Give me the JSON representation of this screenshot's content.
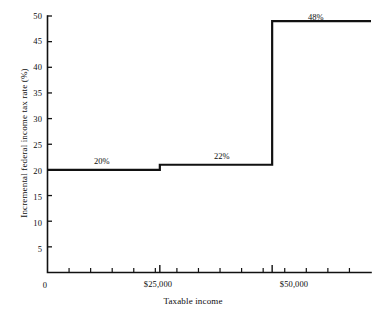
{
  "chart_data": {
    "type": "line",
    "subtype": "step",
    "title": "",
    "xlabel": "Taxable income",
    "ylabel": "Incremental federal income tax rate (%)",
    "xlim": [
      0,
      72000
    ],
    "ylim": [
      0,
      50
    ],
    "grid": false,
    "legend": "none",
    "y_ticks": [
      0,
      5,
      10,
      15,
      20,
      25,
      30,
      35,
      40,
      45,
      50
    ],
    "y_tick_labels": [
      "0",
      "5",
      "10",
      "15",
      "20",
      "25",
      "30",
      "35",
      "40",
      "45",
      "50"
    ],
    "y_tick_direction": "inward",
    "x_tick_labels": [
      "0",
      "$25,000",
      "$50,000"
    ],
    "x_tick_values": [
      0,
      25000,
      50000
    ],
    "x_minor_tick_count": 14,
    "x_tick_direction": "inward",
    "origin_label": "0",
    "steps": [
      {
        "x_start": 0,
        "x_end": 25000,
        "rate": 20,
        "label": "20%",
        "plotted_level": 20
      },
      {
        "x_start": 25000,
        "x_end": 50000,
        "rate": 22,
        "label": "22%",
        "plotted_level": 21
      },
      {
        "x_start": 50000,
        "x_end": 72000,
        "rate": 48,
        "label": "48%",
        "plotted_level": 49
      }
    ],
    "annotations": [
      {
        "text": "20%",
        "x": 12000,
        "y": 22.5
      },
      {
        "text": "22%",
        "x": 37000,
        "y": 23.5
      },
      {
        "text": "48%",
        "x": 57000,
        "y": 51.5
      }
    ],
    "line_color": "#111111",
    "line_width": 2.2,
    "axis_color": "#111111",
    "background_color": "#ffffff"
  }
}
